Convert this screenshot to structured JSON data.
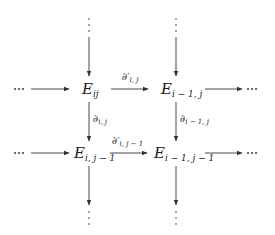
{
  "diagram": {
    "type": "commutative-diagram",
    "ellipsis": "⋯",
    "nodes": {
      "e_ij": {
        "main": "E",
        "sub": "ij"
      },
      "e_im1_j": {
        "main": "E",
        "sub": "i − 1, j"
      },
      "e_i_jm1": {
        "main": "E",
        "sub": "i, j − 1"
      },
      "e_im1_jm1": {
        "main": "E",
        "sub": "i − 1, j − 1"
      }
    },
    "arrows": {
      "h_top": {
        "main": "∂′",
        "sub": "i, j"
      },
      "h_bottom": {
        "main": "∂′",
        "sub": "i, j − 1"
      },
      "v_left": {
        "main": "∂",
        "sub": "i, j"
      },
      "v_right": {
        "main": "∂",
        "sub": "i − 1, j"
      }
    }
  }
}
